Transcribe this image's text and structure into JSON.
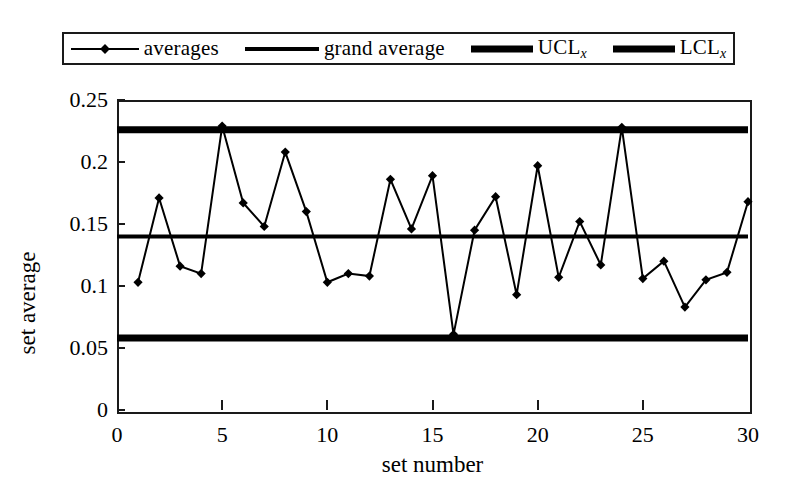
{
  "chart_data": {
    "type": "line",
    "title": "",
    "xlabel": "set number",
    "ylabel": "set average",
    "xlim": [
      0,
      30
    ],
    "ylim": [
      0,
      0.25
    ],
    "xticks": [
      0,
      5,
      10,
      15,
      20,
      25,
      30
    ],
    "yticks": [
      0,
      0.05,
      0.1,
      0.15,
      0.2,
      0.25
    ],
    "ytick_labels": [
      "0",
      "0.05",
      "0.1",
      "0.15",
      "0.2",
      "0.25"
    ],
    "xtick_labels": [
      "0",
      "5",
      "10",
      "15",
      "20",
      "25",
      "30"
    ],
    "grid": false,
    "legend_position": "above-plot",
    "x": [
      1,
      2,
      3,
      4,
      5,
      6,
      7,
      8,
      9,
      10,
      11,
      12,
      13,
      14,
      15,
      16,
      17,
      18,
      19,
      20,
      21,
      22,
      23,
      24,
      25,
      26,
      27,
      28,
      29,
      30
    ],
    "series": [
      {
        "name": "averages",
        "style": "line-with-diamond-markers",
        "values": [
          0.103,
          0.171,
          0.116,
          0.11,
          0.229,
          0.167,
          0.148,
          0.208,
          0.16,
          0.103,
          0.11,
          0.108,
          0.186,
          0.146,
          0.189,
          0.061,
          0.145,
          0.172,
          0.093,
          0.197,
          0.107,
          0.152,
          0.117,
          0.228,
          0.106,
          0.12,
          0.083,
          0.105,
          0.111,
          0.168
        ]
      }
    ],
    "reference_lines": [
      {
        "name": "grand average",
        "value": 0.14,
        "style": "medium"
      },
      {
        "name": "UCL_x",
        "value": 0.226,
        "style": "heavy"
      },
      {
        "name": "LCL_x",
        "value": 0.058,
        "style": "heavy"
      }
    ]
  },
  "legend": {
    "entries": [
      {
        "label": "averages",
        "sub": "",
        "swatch": "thin"
      },
      {
        "label": "grand average",
        "sub": "",
        "swatch": "med"
      },
      {
        "label": "UCL",
        "sub": "x",
        "swatch": "heavy"
      },
      {
        "label": "LCL",
        "sub": "x",
        "swatch": "heavy"
      }
    ]
  },
  "colors": {
    "ink": "#000000",
    "frame": "#1a1a1a",
    "background": "#ffffff"
  }
}
